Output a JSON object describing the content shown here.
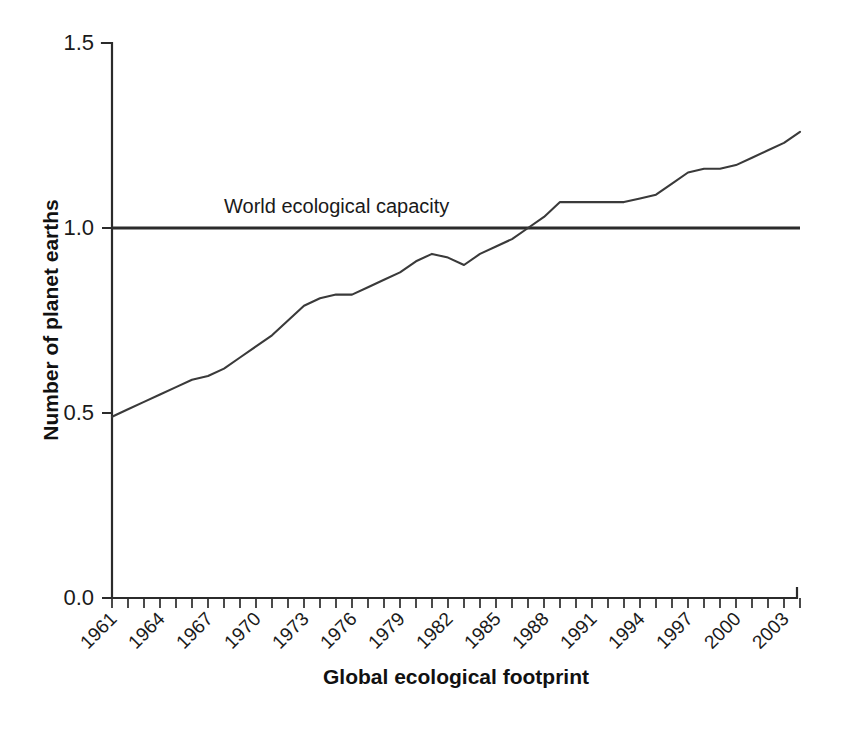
{
  "chart_data": {
    "type": "line",
    "title": "",
    "xlabel": "Global ecological footprint",
    "ylabel": "Number of planet earths",
    "xlim": [
      1961,
      2004
    ],
    "ylim": [
      0.0,
      1.5
    ],
    "grid": false,
    "legend": "none",
    "y_ticks": [
      "0.0",
      "0.5",
      "1.0",
      "1.5"
    ],
    "y_tick_values": [
      0.0,
      0.5,
      1.0,
      1.5
    ],
    "x_tick_labels": [
      "1961",
      "1964",
      "1967",
      "1970",
      "1973",
      "1976",
      "1979",
      "1982",
      "1985",
      "1988",
      "1991",
      "1994",
      "1997",
      "2000",
      "2003"
    ],
    "x_tick_values": [
      1961,
      1964,
      1967,
      1970,
      1973,
      1976,
      1979,
      1982,
      1985,
      1988,
      1991,
      1994,
      1997,
      2000,
      2003
    ],
    "x_minor_tick_values": [
      1961,
      1962,
      1963,
      1964,
      1965,
      1966,
      1967,
      1968,
      1969,
      1970,
      1971,
      1972,
      1973,
      1974,
      1975,
      1976,
      1977,
      1978,
      1979,
      1980,
      1981,
      1982,
      1983,
      1984,
      1985,
      1986,
      1987,
      1988,
      1989,
      1990,
      1991,
      1992,
      1993,
      1994,
      1995,
      1996,
      1997,
      1998,
      1999,
      2000,
      2001,
      2002,
      2003,
      2004
    ],
    "annotations": [
      {
        "text": "World ecological capacity",
        "x": 1968,
        "y": 1.04
      }
    ],
    "series": [
      {
        "name": "World ecological capacity",
        "kind": "reference-line",
        "constant_value": 1.0,
        "x": [
          1961,
          2004
        ],
        "values": [
          1.0,
          1.0
        ]
      },
      {
        "name": "Global ecological footprint",
        "kind": "data-line",
        "x": [
          1961,
          1962,
          1963,
          1964,
          1965,
          1966,
          1967,
          1968,
          1969,
          1970,
          1971,
          1972,
          1973,
          1974,
          1975,
          1976,
          1977,
          1978,
          1979,
          1980,
          1981,
          1982,
          1983,
          1984,
          1985,
          1986,
          1987,
          1988,
          1989,
          1990,
          1991,
          1992,
          1993,
          1994,
          1995,
          1996,
          1997,
          1998,
          1999,
          2000,
          2001,
          2002,
          2003,
          2004
        ],
        "values": [
          0.49,
          0.51,
          0.53,
          0.55,
          0.57,
          0.59,
          0.6,
          0.62,
          0.65,
          0.68,
          0.71,
          0.75,
          0.79,
          0.81,
          0.82,
          0.82,
          0.84,
          0.86,
          0.88,
          0.91,
          0.93,
          0.92,
          0.9,
          0.93,
          0.95,
          0.97,
          1.0,
          1.03,
          1.07,
          1.07,
          1.07,
          1.07,
          1.07,
          1.08,
          1.09,
          1.12,
          1.15,
          1.16,
          1.16,
          1.17,
          1.19,
          1.21,
          1.23,
          1.26
        ]
      }
    ]
  }
}
